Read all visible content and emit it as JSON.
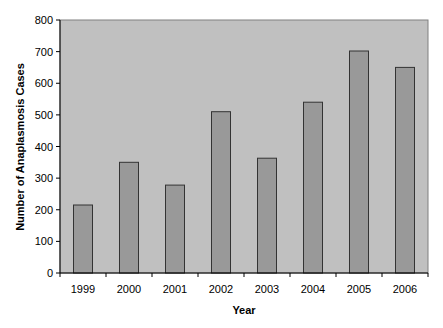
{
  "chart_data": {
    "type": "bar",
    "title": "",
    "xlabel": "Year",
    "ylabel": "Number of Anaplasmosis Cases",
    "categories": [
      "1999",
      "2000",
      "2001",
      "2002",
      "2003",
      "2004",
      "2005",
      "2006"
    ],
    "values": [
      215,
      350,
      278,
      510,
      363,
      540,
      702,
      650
    ],
    "ylim": [
      0,
      800
    ],
    "yticks": [
      0,
      100,
      200,
      300,
      400,
      500,
      600,
      700,
      800
    ],
    "grid": false,
    "legend": null
  },
  "colors": {
    "plot_background": "#c0c0c0",
    "bar_fill": "#999999",
    "bar_stroke": "#333333",
    "axis": "#000000"
  }
}
